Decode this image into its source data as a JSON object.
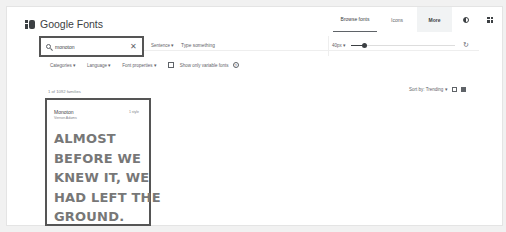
{
  "app": {
    "title": "Google Fonts"
  },
  "topnav": {
    "tabs": [
      {
        "label": "Browse fonts",
        "active": true
      },
      {
        "label": "Icons",
        "active": false
      },
      {
        "label": "More",
        "active": false
      }
    ],
    "icons": [
      "contrast-icon",
      "apps-grid-icon"
    ]
  },
  "search": {
    "value": "monoton",
    "clear_glyph": "✕",
    "preview_mode": "Sentence ▾",
    "preview_placeholder": "Type something",
    "size": "40px ▾",
    "slider_value_px": 40,
    "reset_glyph": "↻"
  },
  "filters": {
    "items": [
      "Categories ▾",
      "Language ▾",
      "Font properties ▾"
    ],
    "variable_label": "Show only variable fonts",
    "variable_checked": false,
    "info_glyph": "?"
  },
  "results": {
    "count_text": "1 of 1092 families",
    "sort_label": "Sort by: Trending ▾"
  },
  "card": {
    "name": "Monoton",
    "author": "Vernon Adams",
    "styles": "1 style",
    "sample_lines": [
      "ALMOST",
      "BEFORE WE",
      "KNEW IT, WE",
      "HAD LEFT THE",
      "GROUND."
    ]
  },
  "colors": {
    "text": "#3c4043",
    "muted": "#5f6368",
    "highlight_border": "#555555",
    "more_bg": "#f1f3f4"
  }
}
